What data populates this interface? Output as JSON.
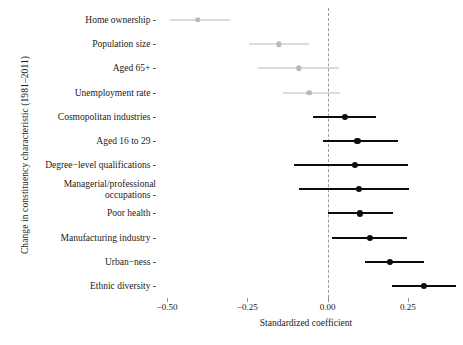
{
  "chart_data": {
    "type": "scatter",
    "title": "",
    "xlabel": "Standardized coefficient",
    "ylabel": "Change in constituency characteristic (1981–2011)",
    "xlim": [
      -0.535,
      0.4
    ],
    "xticks": [
      -0.5,
      -0.25,
      0.0,
      0.25
    ],
    "xticklabels": [
      "−0.50",
      "−0.25",
      "0.00",
      "0.25"
    ],
    "grid": false,
    "legend": "none",
    "reference_line": 0.0,
    "orientation": "horizontal",
    "categories": [
      "Home ownership",
      "Population size",
      "Aged 65+",
      "Unemployment rate",
      "Cosmopolitan industries",
      "Aged 16 to 29",
      "Degree−level qualifications",
      "Managerial/professional\noccupations",
      "Poor health",
      "Manufacturing industry",
      "Urban−ness",
      "Ethnic diversity"
    ],
    "points": [
      {
        "label": "Home ownership",
        "estimate": -0.405,
        "ci_low": -0.49,
        "ci_high": -0.305,
        "significant": false
      },
      {
        "label": "Population size",
        "estimate": -0.152,
        "ci_low": -0.245,
        "ci_high": -0.058,
        "significant": false
      },
      {
        "label": "Aged 65+",
        "estimate": -0.09,
        "ci_low": -0.218,
        "ci_high": 0.035,
        "significant": false
      },
      {
        "label": "Unemployment rate",
        "estimate": -0.057,
        "ci_low": -0.14,
        "ci_high": 0.038,
        "significant": false
      },
      {
        "label": "Cosmopolitan industries",
        "estimate": 0.053,
        "ci_low": -0.047,
        "ci_high": 0.152,
        "significant": true
      },
      {
        "label": "Aged 16 to 29",
        "estimate": 0.093,
        "ci_low": -0.013,
        "ci_high": 0.218,
        "significant": true
      },
      {
        "label": "Degree−level qualifications",
        "estimate": 0.085,
        "ci_low": -0.105,
        "ci_high": 0.252,
        "significant": true
      },
      {
        "label": "Managerial/professional occupations",
        "estimate": 0.098,
        "ci_low": -0.088,
        "ci_high": 0.255,
        "significant": true
      },
      {
        "label": "Poor health",
        "estimate": 0.1,
        "ci_low": 0.0,
        "ci_high": 0.205,
        "significant": true
      },
      {
        "label": "Manufacturing industry",
        "estimate": 0.132,
        "ci_low": 0.012,
        "ci_high": 0.248,
        "significant": true
      },
      {
        "label": "Urban−ness",
        "estimate": 0.193,
        "ci_low": 0.115,
        "ci_high": 0.3,
        "significant": true
      },
      {
        "label": "Ethnic diversity",
        "estimate": 0.3,
        "ci_low": 0.2,
        "ci_high": 0.4,
        "significant": true
      }
    ],
    "colors": {
      "significant": "#0d0d0d",
      "nonsignificant": "#b9b9b9",
      "reference_line": "#9a9a9a",
      "background": "#ffffff"
    }
  }
}
